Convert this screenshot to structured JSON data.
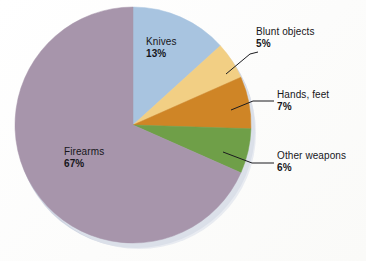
{
  "figure": {
    "background": "#fdfdfc",
    "label_color": "#16161a"
  },
  "chart_data": {
    "type": "pie",
    "title": "",
    "subtitle": "",
    "xlabel": "",
    "ylabel": "",
    "grid": false,
    "legend_position": "none",
    "label_style": "callout",
    "start_angle_deg": 0,
    "direction": "clockwise",
    "units": "percent",
    "total": 98,
    "categories": [
      "Knives",
      "Blunt objects",
      "Hands, feet",
      "Other weapons",
      "Firearms"
    ],
    "values": [
      13,
      5,
      7,
      6,
      67
    ],
    "colors": [
      "#a8c4e0",
      "#f2cf84",
      "#cf8526",
      "#6f9f48",
      "#a795ab"
    ],
    "slices": [
      {
        "label": "Knives",
        "value": 13,
        "percent_text": "13%",
        "color": "#a8c4e0",
        "label_placement": "inside",
        "leader_line": false
      },
      {
        "label": "Blunt objects",
        "value": 5,
        "percent_text": "5%",
        "color": "#f2cf84",
        "label_placement": "outside",
        "leader_line": true
      },
      {
        "label": "Hands, feet",
        "value": 7,
        "percent_text": "7%",
        "color": "#cf8526",
        "label_placement": "outside",
        "leader_line": true
      },
      {
        "label": "Other weapons",
        "value": 6,
        "percent_text": "6%",
        "color": "#6f9f48",
        "label_placement": "outside",
        "leader_line": true
      },
      {
        "label": "Firearms",
        "value": 67,
        "percent_text": "67%",
        "color": "#a795ab",
        "label_placement": "inside",
        "leader_line": false
      }
    ]
  },
  "labels": {
    "knives": {
      "name": "Knives",
      "pct": "13%"
    },
    "blunt": {
      "name": "Blunt objects",
      "pct": "5%"
    },
    "hands": {
      "name": "Hands, feet",
      "pct": "7%"
    },
    "other": {
      "name": "Other weapons",
      "pct": "6%"
    },
    "firearms": {
      "name": "Firearms",
      "pct": "67%"
    }
  }
}
